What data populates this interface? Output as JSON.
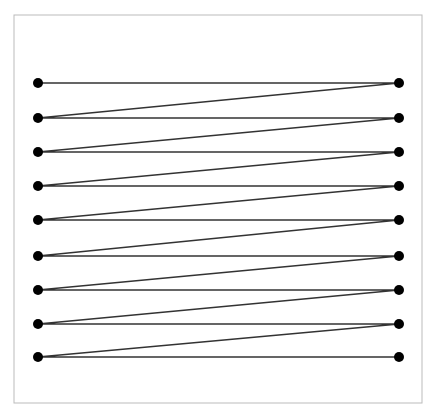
{
  "title": "",
  "chart_data": {
    "type": "line",
    "title": "",
    "frame": {
      "x": 14,
      "y": 15,
      "width": 408,
      "height": 388,
      "stroke": "#bbbbbb"
    },
    "left_x": 38,
    "right_x": 399,
    "rows_y": [
      83,
      118,
      152,
      186,
      220,
      256,
      290,
      324,
      357
    ],
    "path_order": "L1,R1,L2,R2,L3,R3,L4,R4,L5,R5,L6,R6,L7,R7,L8,R8,L9,R9",
    "point_radius": 5,
    "point_color": "#000000",
    "line_color": "#333333",
    "grid": false,
    "legend": null
  }
}
